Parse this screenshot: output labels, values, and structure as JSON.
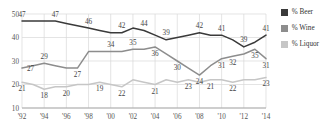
{
  "legend": {
    "items": [
      {
        "label": "% Beer",
        "color": "#3a3a3a"
      },
      {
        "label": "% Wine",
        "color": "#8d8d8d"
      },
      {
        "label": "% Liquor",
        "color": "#c6c6c6"
      }
    ]
  },
  "chart_data": {
    "type": "line",
    "title": "",
    "xlabel": "",
    "ylabel": "",
    "ylim": [
      10,
      50
    ],
    "yticks": [
      10,
      20,
      30,
      40,
      50
    ],
    "ytick_labels": [
      "10",
      "20",
      "30",
      "40",
      "50"
    ],
    "grid": true,
    "legend_position": "right",
    "x": [
      1992,
      1993,
      1994,
      1995,
      1996,
      1997,
      1998,
      1999,
      2000,
      2001,
      2002,
      2003,
      2004,
      2005,
      2006,
      2007,
      2008,
      2009,
      2010,
      2011,
      2012,
      2013,
      2014
    ],
    "xticks": [
      1992,
      1994,
      1996,
      1998,
      2000,
      2002,
      2004,
      2006,
      2008,
      2010,
      2012,
      2014
    ],
    "xtick_labels": [
      "'92",
      "'94",
      "'96",
      "'98",
      "'00",
      "'02",
      "'04",
      "'06",
      "'08",
      "'10",
      "'12",
      "'14"
    ],
    "series": [
      {
        "name": "% Beer",
        "color": "#3a3a3a",
        "values": [
          47,
          47,
          47,
          47,
          46,
          45,
          44,
          43,
          42,
          42,
          44,
          43,
          41,
          39,
          40,
          41,
          42,
          41,
          41,
          39,
          36,
          38,
          41
        ],
        "labels": [
          {
            "x": 1992,
            "value": 47,
            "pos": "above"
          },
          {
            "x": 1995,
            "value": 47,
            "pos": "above"
          },
          {
            "x": 1998,
            "value": 46,
            "pos": "above"
          },
          {
            "x": 2001,
            "value": 42,
            "pos": "above"
          },
          {
            "x": 2003,
            "value": 44,
            "pos": "above"
          },
          {
            "x": 2005,
            "value": 39,
            "pos": "above"
          },
          {
            "x": 2008,
            "value": 42,
            "pos": "above"
          },
          {
            "x": 2010,
            "value": 41,
            "pos": "above"
          },
          {
            "x": 2012,
            "value": 39,
            "pos": "above"
          },
          {
            "x": 2014,
            "value": 41,
            "pos": "above"
          }
        ]
      },
      {
        "name": "% Wine",
        "color": "#8d8d8d",
        "values": [
          27,
          28,
          29,
          28,
          27,
          27,
          34,
          34,
          34,
          34,
          35,
          35,
          36,
          33,
          30,
          27,
          24,
          28,
          31,
          32,
          33,
          35,
          31
        ],
        "labels": [
          {
            "x": 1992,
            "value": 27,
            "pos": "left"
          },
          {
            "x": 1994,
            "value": 29,
            "pos": "above"
          },
          {
            "x": 1997,
            "value": 27,
            "pos": "below"
          },
          {
            "x": 2000,
            "value": 34,
            "pos": "above"
          },
          {
            "x": 2002,
            "value": 35,
            "pos": "above"
          },
          {
            "x": 2004,
            "value": 36,
            "pos": "below"
          },
          {
            "x": 2006,
            "value": 30,
            "pos": "below"
          },
          {
            "x": 2008,
            "value": 24,
            "pos": "below"
          },
          {
            "x": 2010,
            "value": 31,
            "pos": "below"
          },
          {
            "x": 2011,
            "value": 32,
            "pos": "below"
          },
          {
            "x": 2013,
            "value": 35,
            "pos": "below"
          },
          {
            "x": 2014,
            "value": 31,
            "pos": "below"
          }
        ]
      },
      {
        "name": "% Liquor",
        "color": "#c6c6c6",
        "values": [
          21,
          20,
          18,
          19,
          19,
          20,
          20,
          21,
          20,
          19,
          22,
          21,
          20,
          22,
          21,
          22,
          21,
          22,
          22,
          21,
          22,
          22,
          23
        ],
        "labels": [
          {
            "x": 1992,
            "value": 21,
            "pos": "below"
          },
          {
            "x": 1994,
            "value": 18,
            "pos": "below"
          },
          {
            "x": 1996,
            "value": 20,
            "pos": "below"
          },
          {
            "x": 1999,
            "value": 19,
            "pos": "below"
          },
          {
            "x": 2001,
            "value": 22,
            "pos": "below"
          },
          {
            "x": 2004,
            "value": 21,
            "pos": "below"
          },
          {
            "x": 2007,
            "value": 23,
            "pos": "below"
          },
          {
            "x": 2009,
            "value": 21,
            "pos": "below"
          },
          {
            "x": 2011,
            "value": 22,
            "pos": "below"
          },
          {
            "x": 2014,
            "value": 23,
            "pos": "below"
          }
        ]
      }
    ]
  }
}
